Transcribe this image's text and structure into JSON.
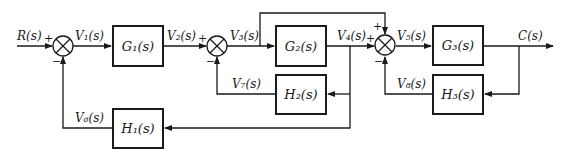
{
  "diagram": {
    "type": "control-system-block-diagram",
    "input": "R(s)",
    "output": "C(s)",
    "blocks": [
      {
        "id": "G1",
        "label": "G₁(s)"
      },
      {
        "id": "G2",
        "label": "G₂(s)"
      },
      {
        "id": "G3",
        "label": "G₃(s)"
      },
      {
        "id": "H1",
        "label": "H₁(s)"
      },
      {
        "id": "H2",
        "label": "H₂(s)"
      },
      {
        "id": "H3",
        "label": "H₃(s)"
      }
    ],
    "signals": {
      "R": "R(s)",
      "V1": "V₁(s)",
      "V2": "V₂(s)",
      "V3": "V₃(s)",
      "V4": "V₄(s)",
      "V5": "V₅(s)",
      "V6": "V₆(s)",
      "V7": "V₇(s)",
      "V8": "V₈(s)",
      "C": "C(s)"
    },
    "summing_junctions": [
      {
        "id": "S1",
        "inputs": [
          {
            "from": "R(s)",
            "sign": "+"
          },
          {
            "from": "V₆(s)",
            "sign": "−"
          }
        ]
      },
      {
        "id": "S2",
        "inputs": [
          {
            "from": "V₂(s)",
            "sign": "+"
          },
          {
            "from": "V₇(s)",
            "sign": "−"
          }
        ]
      },
      {
        "id": "S3",
        "inputs": [
          {
            "from": "V₄(s)",
            "sign": "+"
          },
          {
            "from": "V₃(s)",
            "sign": "+"
          },
          {
            "from": "V₈(s)",
            "sign": "−"
          }
        ]
      }
    ],
    "signs": {
      "s1_plus": "+",
      "s1_minus": "−",
      "s2_plus": "+",
      "s2_minus": "−",
      "s3_plus_left": "+",
      "s3_plus_top": "+",
      "s3_minus": "−"
    }
  }
}
